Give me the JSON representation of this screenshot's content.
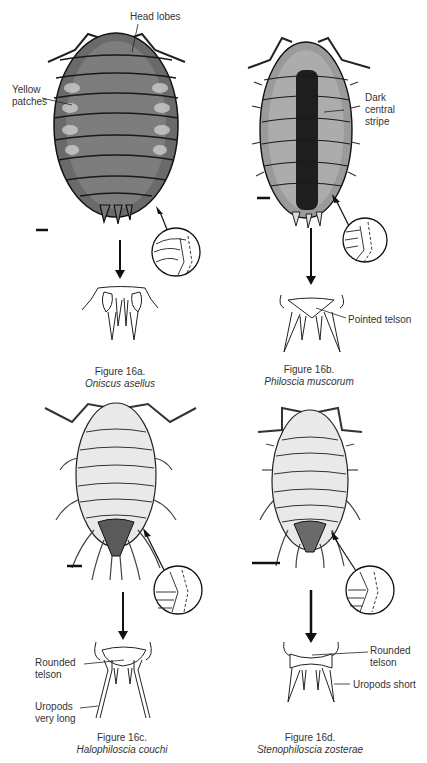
{
  "figures": [
    {
      "id": "16a",
      "caption": "Figure 16a.",
      "species": "Oniscus asellus",
      "annotations": [
        "Head lobes",
        "Yellow patches"
      ]
    },
    {
      "id": "16b",
      "caption": "Figure 16b.",
      "species": "Philoscia muscorum",
      "annotations": [
        "Dark central stripe",
        "Pointed telson"
      ]
    },
    {
      "id": "16c",
      "caption": "Figure 16c.",
      "species": "Halophiloscia couchi",
      "annotations": [
        "Rounded telson",
        "Uropods very long"
      ]
    },
    {
      "id": "16d",
      "caption": "Figure 16d.",
      "species": "Stenophiloscia zosterae",
      "annotations": [
        "Rounded telson",
        "Uropods short"
      ]
    }
  ],
  "labels": {
    "a_head_lobes": "Head lobes",
    "a_yellow_1": "Yellow",
    "a_yellow_2": "patches",
    "b_dark_1": "Dark",
    "b_dark_2": "central",
    "b_dark_3": "stripe",
    "b_pointed": "Pointed telson",
    "c_rounded_1": "Rounded",
    "c_rounded_2": "telson",
    "c_uropods_1": "Uropods",
    "c_uropods_2": "very long",
    "d_rounded_1": "Rounded",
    "d_rounded_2": "telson",
    "d_uropods": "Uropods short"
  },
  "colors": {
    "ink": "#1e1e1e",
    "body_dark": "#5a5a5a",
    "body_light": "#e6e6e6",
    "stripe": "#222222"
  }
}
